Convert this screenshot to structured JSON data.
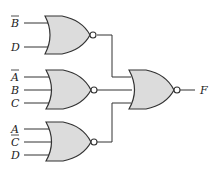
{
  "diagram": {
    "type": "logic-circuit",
    "gates": [
      {
        "id": "nor1",
        "type": "NOR",
        "inputs": [
          "B̄",
          "D"
        ]
      },
      {
        "id": "nor2",
        "type": "NOR",
        "inputs": [
          "Ā",
          "B",
          "C"
        ]
      },
      {
        "id": "nor3",
        "type": "NOR",
        "inputs": [
          "A",
          "C̄",
          "D"
        ]
      },
      {
        "id": "nor4",
        "type": "NOR",
        "inputs": [
          "nor1",
          "nor2",
          "nor3"
        ],
        "output": "F"
      }
    ],
    "labels": {
      "g1_in1": "B",
      "g1_in2": "D",
      "g2_in1": "A",
      "g2_in2": "B",
      "g2_in3": "C",
      "g3_in1": "A",
      "g3_in2": "C",
      "g3_in3": "D",
      "output": "F"
    },
    "overbars": [
      "g1_in1",
      "g2_in1",
      "g3_in2"
    ]
  }
}
